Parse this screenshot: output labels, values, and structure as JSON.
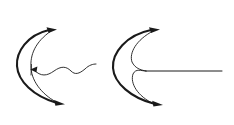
{
  "figure": {
    "background_color": "#ffffff",
    "stroke_color": "#1a1a1a",
    "width": 234,
    "height": 125,
    "panels": [
      {
        "id": "left-panel",
        "name": "dispersive-wave-panel",
        "description": "Bold crescent wavefront with a thin inner arc and an outgoing sinusoidal wave",
        "elements": [
          {
            "name": "outer-crescent-arc",
            "kind": "arc",
            "weight": "thick",
            "stroke_width": 2.1,
            "path": "M 49 30 C 27 35, 16 52, 17 66 C 18 81, 33 96, 57 103",
            "arrowheads": [
              "start-top",
              "end-bottom"
            ]
          },
          {
            "name": "inner-crescent-arc",
            "kind": "arc",
            "weight": "thin",
            "stroke_width": 0.9,
            "path": "M 51 31 C 35 42, 30 55, 31 68 C 32 83, 44 96, 58 103",
            "arrowheads": []
          },
          {
            "name": "sinusoidal-wave",
            "kind": "wave",
            "weight": "thin",
            "stroke_width": 0.9,
            "path": "M 34 70 C 41 77, 47 76, 54 71 C 61 66, 66 66, 71 71 C 75 75, 79 74, 85 69 C 89 65, 93 64, 96 64",
            "arrowheads": [
              "start-left"
            ],
            "cycles": 2
          }
        ]
      },
      {
        "id": "right-panel",
        "name": "cusp-caustic-panel",
        "description": "Bold crescent wavefront with two inner arcs meeting at a cusp, and a straight ray to the right",
        "elements": [
          {
            "name": "outer-crescent-arc",
            "kind": "arc",
            "weight": "thick",
            "stroke_width": 2.1,
            "path": "M 151 30 C 126 35, 112 53, 113 68 C 114 83, 131 98, 155 104",
            "arrowheads": [
              "start-top",
              "end-bottom"
            ]
          },
          {
            "name": "inner-upper-arc",
            "kind": "arc",
            "weight": "thin",
            "stroke_width": 0.9,
            "path": "M 153 31 C 136 40, 129 53, 132 62 C 135 68, 140 70, 146 71",
            "arrowheads": []
          },
          {
            "name": "inner-lower-arc",
            "kind": "arc",
            "weight": "thin",
            "stroke_width": 0.9,
            "path": "M 154 104 C 137 96, 130 83, 133 74 C 136 68, 141 71, 146 71",
            "arrowheads": []
          },
          {
            "name": "straight-ray",
            "kind": "line",
            "weight": "thin",
            "stroke_width": 1.0,
            "path": "M 146 71 L 222 71",
            "arrowheads": []
          }
        ]
      }
    ]
  }
}
